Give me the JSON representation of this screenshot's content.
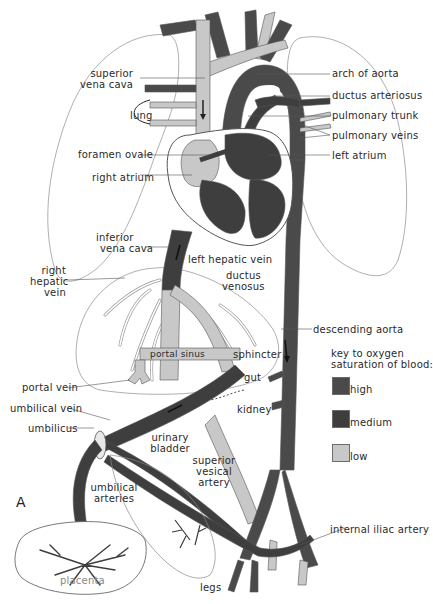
{
  "diagram": {
    "panel_letter": "A",
    "colors": {
      "high": "#4a4a4a",
      "medium": "#3e3e3e",
      "low": "#c8c8c8",
      "outline": "#555555",
      "organ_outline": "#9a9a9a",
      "background": "#ffffff"
    },
    "labels": {
      "superior_vena_cava_1": "superior",
      "superior_vena_cava_2": "vena cava",
      "lung": "lung",
      "foramen_ovale": "foramen ovale",
      "right_atrium": "right atrium",
      "arch_of_aorta": "arch of aorta",
      "ductus_arteriosus": "ductus arteriosus",
      "pulmonary_trunk": "pulmonary trunk",
      "pulmonary_veins": "pulmonary veins",
      "left_atrium": "left atrium",
      "inferior_vena_cava_1": "inferior",
      "inferior_vena_cava_2": "vena cava",
      "left_hepatic_vein": "left hepatic vein",
      "ductus_venosus_1": "ductus",
      "ductus_venosus_2": "venosus",
      "right_hepatic_vein_1": "right",
      "right_hepatic_vein_2": "hepatic",
      "right_hepatic_vein_3": "vein",
      "descending_aorta": "descending aorta",
      "portal_sinus": "portal sinus",
      "sphincter": "sphincter",
      "gut": "gut",
      "portal_vein": "portal vein",
      "kidney": "kidney",
      "umbilical_vein": "umbilical vein",
      "umbilicus": "umbilicus",
      "urinary_bladder_1": "urinary",
      "urinary_bladder_2": "bladder",
      "superior_vesical_artery_1": "superior",
      "superior_vesical_artery_2": "vesical",
      "superior_vesical_artery_3": "artery",
      "umbilical_arteries_1": "umbilical",
      "umbilical_arteries_2": "arteries",
      "internal_iliac_artery": "internal iliac artery",
      "placenta": "placenta",
      "legs": "legs"
    },
    "key": {
      "title_1": "key to oxygen",
      "title_2": "saturation of blood:",
      "items": [
        {
          "label": "high",
          "color": "#4a4a4a"
        },
        {
          "label": "medium",
          "color": "#3e3e3e"
        },
        {
          "label": "low",
          "color": "#c8c8c8"
        }
      ]
    }
  }
}
